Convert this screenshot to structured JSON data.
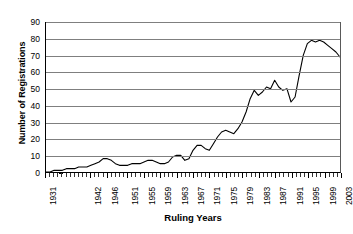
{
  "chart_data": {
    "type": "line",
    "title": "",
    "xlabel": "Ruling Years",
    "ylabel": "Number of Registrations",
    "ylim": [
      0,
      90
    ],
    "ytick_step": 10,
    "yticks": [
      90,
      80,
      70,
      60,
      50,
      40,
      30,
      20,
      10,
      0
    ],
    "xlim": [
      1931,
      2003
    ],
    "xtick_labels": [
      "1931",
      "1942",
      "1946",
      "1951",
      "1955",
      "1959",
      "1963",
      "1967",
      "1971",
      "1975",
      "1979",
      "1983",
      "1987",
      "1991",
      "1995",
      "1999",
      "2003"
    ],
    "xtick_years": [
      1931,
      1942,
      1946,
      1951,
      1955,
      1959,
      1963,
      1967,
      1971,
      1975,
      1979,
      1983,
      1987,
      1991,
      1995,
      1999,
      2003
    ],
    "grid": "horizontal",
    "legend": "none",
    "line_color": "#000000",
    "gridline_color": "#7f7f7f",
    "background_color": "#ffffff",
    "series": [
      {
        "name": "Registrations",
        "x": [
          1931,
          1932,
          1933,
          1934,
          1935,
          1936,
          1937,
          1938,
          1939,
          1940,
          1941,
          1942,
          1943,
          1944,
          1945,
          1946,
          1947,
          1948,
          1949,
          1950,
          1951,
          1952,
          1953,
          1954,
          1955,
          1956,
          1957,
          1958,
          1959,
          1960,
          1961,
          1962,
          1963,
          1964,
          1965,
          1966,
          1967,
          1968,
          1969,
          1970,
          1971,
          1972,
          1973,
          1974,
          1975,
          1976,
          1977,
          1978,
          1979,
          1980,
          1981,
          1982,
          1983,
          1984,
          1985,
          1986,
          1987,
          1988,
          1989,
          1990,
          1991,
          1992,
          1993,
          1994,
          1995,
          1996,
          1997,
          1998,
          1999,
          2000,
          2001,
          2002,
          2003
        ],
        "values": [
          0,
          0,
          1,
          1,
          1,
          2,
          2,
          2,
          3,
          3,
          3,
          4,
          5,
          6,
          8,
          8,
          7,
          5,
          4,
          4,
          4,
          5,
          5,
          5,
          6,
          7,
          7,
          6,
          5,
          5,
          6,
          9,
          10,
          10,
          7,
          8,
          13,
          16,
          16,
          14,
          13,
          17,
          21,
          24,
          25,
          24,
          23,
          26,
          30,
          36,
          44,
          49,
          46,
          48,
          51,
          50,
          55,
          51,
          49,
          50,
          42,
          45,
          58,
          70,
          77,
          79,
          78,
          79,
          78,
          76,
          74,
          72,
          69
        ]
      }
    ]
  },
  "axes": {
    "y_title": "Number of Registrations",
    "x_title": "Ruling Years"
  }
}
